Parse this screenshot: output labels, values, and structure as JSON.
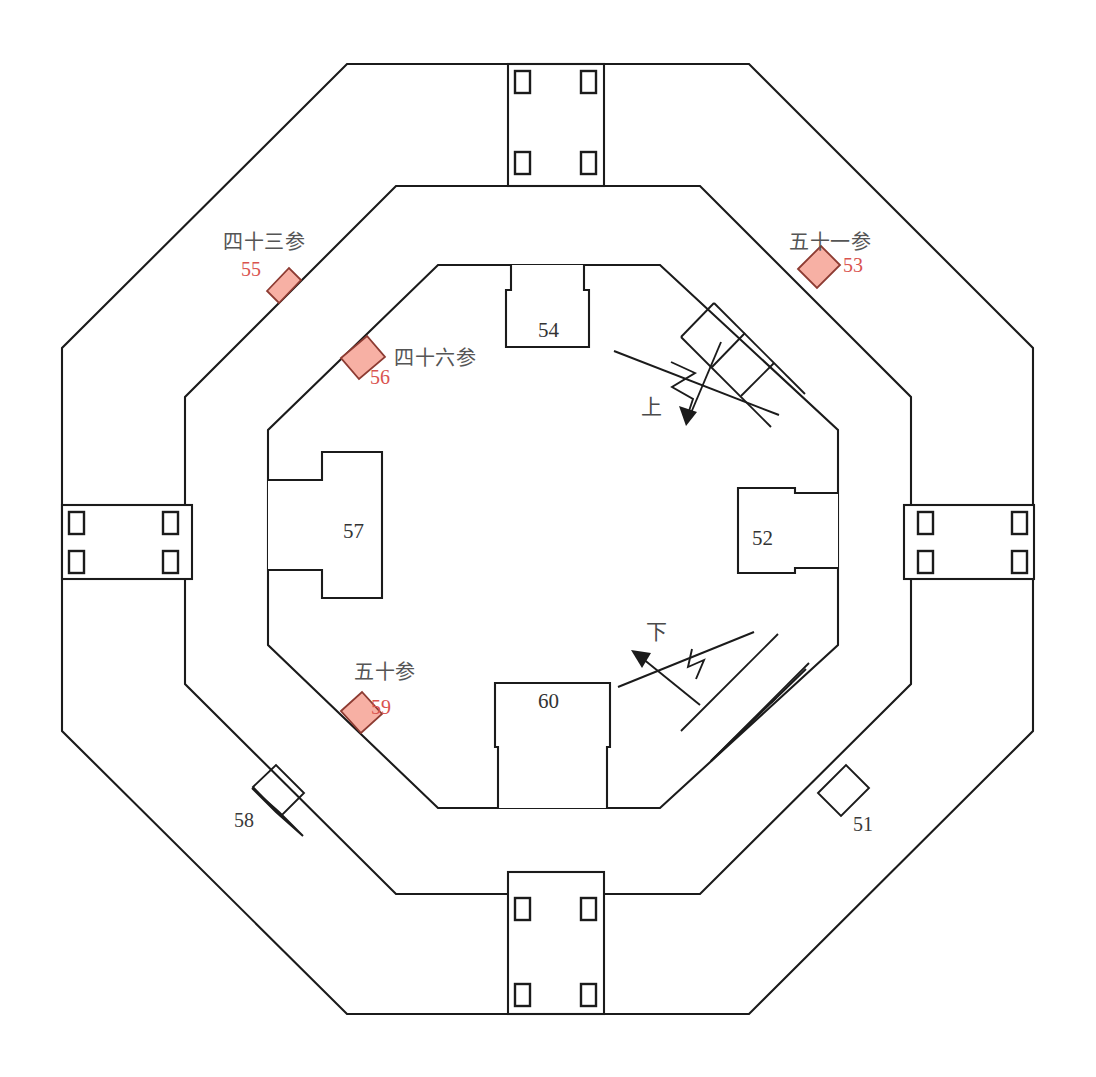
{
  "diagram": {
    "type": "architectural-floor-plan",
    "background_color": "#ffffff",
    "wall_color": "#1b1b1b",
    "marker_fill_color": "#f7b0a4",
    "marker_stroke_color": "#8d3b32",
    "red_number_color": "#d9534f"
  },
  "rooms": [
    {
      "id": "room-54",
      "number": "54",
      "position": "top-center-inner"
    },
    {
      "id": "room-57",
      "number": "57",
      "position": "left-center-inner"
    },
    {
      "id": "room-52",
      "number": "52",
      "position": "right-center-inner"
    },
    {
      "id": "room-60",
      "number": "60",
      "position": "bottom-center-inner"
    }
  ],
  "markers": [
    {
      "id": "marker-55",
      "number": "55",
      "chinese": "四十三参",
      "wall": "middle-octagon-northwest",
      "filled": true
    },
    {
      "id": "marker-53",
      "number": "53",
      "chinese": "五十一参",
      "wall": "middle-octagon-northeast",
      "filled": true
    },
    {
      "id": "marker-56",
      "number": "56",
      "chinese": "四十六参",
      "wall": "inner-octagon-northwest",
      "filled": true
    },
    {
      "id": "marker-59",
      "number": "59",
      "chinese": "五十参",
      "wall": "inner-octagon-southwest",
      "filled": true
    }
  ],
  "plain_markers": [
    {
      "id": "marker-58",
      "number": "58",
      "wall": "middle-octagon-southwest",
      "filled": false
    },
    {
      "id": "marker-51",
      "number": "51",
      "wall": "middle-octagon-southeast",
      "filled": false
    }
  ],
  "stairs": [
    {
      "id": "stair-up",
      "label": "上",
      "position": "upper-right-diagonal",
      "direction": "up"
    },
    {
      "id": "stair-down",
      "label": "下",
      "position": "lower-right-diagonal",
      "direction": "down"
    }
  ],
  "gates": [
    {
      "id": "gate-north",
      "position": "north",
      "pillar_count": 4
    },
    {
      "id": "gate-south",
      "position": "south",
      "pillar_count": 4
    },
    {
      "id": "gate-west",
      "position": "west",
      "pillar_count": 4
    },
    {
      "id": "gate-east",
      "position": "east",
      "pillar_count": 4
    }
  ],
  "structure": {
    "outer_octagon": "outer-wall-ring",
    "middle_octagon": "middle-wall-ring",
    "inner_octagon": "inner-wall-ring"
  }
}
